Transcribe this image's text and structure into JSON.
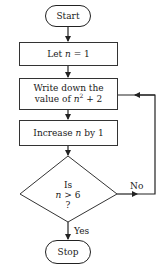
{
  "diagram": {
    "type": "flowchart",
    "nodes": {
      "start": {
        "shape": "terminal",
        "label": "Start"
      },
      "init": {
        "shape": "process",
        "prefix": "Let ",
        "var": "n",
        "suffix": " = 1"
      },
      "write": {
        "shape": "process",
        "line1": "Write down the",
        "line2_prefix": "value of ",
        "var": "n",
        "exp": "2",
        "line2_suffix": " + 2"
      },
      "increase": {
        "shape": "process",
        "prefix": "Increase ",
        "var": "n",
        "suffix": " by 1"
      },
      "decision": {
        "shape": "diamond",
        "line1": "Is",
        "var": "n",
        "line2_suffix": " > 6",
        "line3": "?"
      },
      "stop": {
        "shape": "terminal",
        "label": "Stop"
      }
    },
    "edges": {
      "yes_label": "Yes",
      "no_label": "No"
    },
    "colors": {
      "stroke": "#222222",
      "background": "#ffffff"
    }
  }
}
